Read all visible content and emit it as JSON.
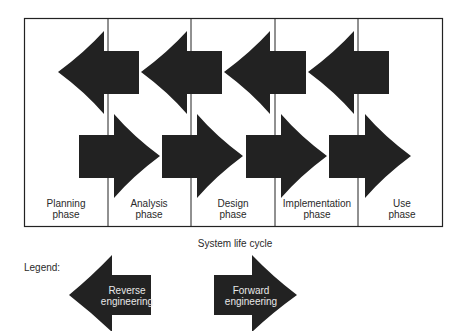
{
  "diagram": {
    "caption": "System life cycle",
    "phases": [
      {
        "line1": "Planning",
        "line2": "phase"
      },
      {
        "line1": "Analysis",
        "line2": "phase"
      },
      {
        "line1": "Design",
        "line2": "phase"
      },
      {
        "line1": "Implementation",
        "line2": "phase"
      },
      {
        "line1": "Use",
        "line2": "phase"
      }
    ],
    "arrow_color": "#222222",
    "reverse_arrow_count": 4,
    "forward_arrow_count": 4
  },
  "legend": {
    "title": "Legend:",
    "reverse": {
      "line1": "Reverse",
      "line2": "engineering"
    },
    "forward": {
      "line1": "Forward",
      "line2": "engineering"
    }
  }
}
